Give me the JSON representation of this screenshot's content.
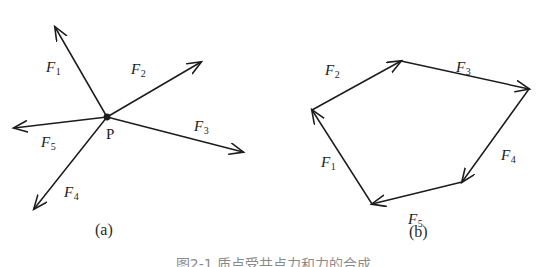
{
  "figure": {
    "caption": "图2-1  质点受共点力和力的合成",
    "caption_clipped": true,
    "stroke_color": "#1c1c1c",
    "background_color": "#ffffff"
  },
  "panels": [
    {
      "id": "a",
      "caption": "(a)",
      "caption_x": 95,
      "caption_y": 222,
      "description": "concurrent forces acting at point P",
      "origin_label": "P",
      "origin_label_x": 106,
      "origin_label_y": 127,
      "origin": {
        "x": 107,
        "y": 117
      },
      "vectors": [
        {
          "name": "F1",
          "label_main": "F",
          "label_sub": "1",
          "from": {
            "x": 107,
            "y": 117
          },
          "to": {
            "x": 55,
            "y": 27
          },
          "label_x": 46,
          "label_y": 60
        },
        {
          "name": "F2",
          "label_main": "F",
          "label_sub": "2",
          "from": {
            "x": 107,
            "y": 117
          },
          "to": {
            "x": 201,
            "y": 62
          },
          "label_x": 131,
          "label_y": 62
        },
        {
          "name": "F3",
          "label_main": "F",
          "label_sub": "3",
          "from": {
            "x": 107,
            "y": 117
          },
          "to": {
            "x": 243,
            "y": 152
          },
          "label_x": 194,
          "label_y": 119
        },
        {
          "name": "F4",
          "label_main": "F",
          "label_sub": "4",
          "from": {
            "x": 107,
            "y": 117
          },
          "to": {
            "x": 34,
            "y": 209
          },
          "label_x": 64,
          "label_y": 185
        },
        {
          "name": "F5",
          "label_main": "F",
          "label_sub": "5",
          "from": {
            "x": 107,
            "y": 117
          },
          "to": {
            "x": 14,
            "y": 128
          },
          "label_x": 41,
          "label_y": 135
        }
      ]
    },
    {
      "id": "b",
      "caption": "(b)",
      "caption_x": 409,
      "caption_y": 224,
      "description": "force polygon formed by the same five vectors placed head to tail",
      "vectors": [
        {
          "name": "F1",
          "label_main": "F",
          "label_sub": "1",
          "from": {
            "x": 372,
            "y": 204
          },
          "to": {
            "x": 312,
            "y": 110
          },
          "label_x": 321,
          "label_y": 155
        },
        {
          "name": "F2",
          "label_main": "F",
          "label_sub": "2",
          "from": {
            "x": 312,
            "y": 110
          },
          "to": {
            "x": 401,
            "y": 61
          },
          "label_x": 325,
          "label_y": 63
        },
        {
          "name": "F3",
          "label_main": "F",
          "label_sub": "3",
          "from": {
            "x": 401,
            "y": 61
          },
          "to": {
            "x": 529,
            "y": 89
          },
          "label_x": 456,
          "label_y": 60
        },
        {
          "name": "F4",
          "label_main": "F",
          "label_sub": "4",
          "from": {
            "x": 529,
            "y": 89
          },
          "to": {
            "x": 462,
            "y": 182
          },
          "label_x": 501,
          "label_y": 148
        },
        {
          "name": "F5",
          "label_main": "F",
          "label_sub": "5",
          "from": {
            "x": 462,
            "y": 182
          },
          "to": {
            "x": 372,
            "y": 204
          },
          "label_x": 408,
          "label_y": 212
        }
      ]
    }
  ]
}
